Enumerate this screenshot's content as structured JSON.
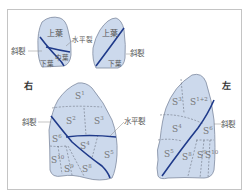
{
  "figure": {
    "top_right_lung": {
      "lobes": [
        "上葉",
        "中葉",
        "下葉"
      ],
      "labels": {
        "oblique_fissure": "斜裂",
        "horizontal_fissure": "水平裂"
      }
    },
    "top_left_lung": {
      "lobes": [
        "上葉",
        "下葉"
      ],
      "labels": {
        "oblique_fissure": "斜裂"
      }
    },
    "right_lung": {
      "side_label": "右",
      "fissure_labels": {
        "oblique": "斜裂",
        "horizontal": "水平裂"
      },
      "segments": [
        {
          "base": "S",
          "sup": "1"
        },
        {
          "base": "S",
          "sup": "2"
        },
        {
          "base": "S",
          "sup": "3"
        },
        {
          "base": "S",
          "sup": "4"
        },
        {
          "base": "S",
          "sup": "5"
        },
        {
          "base": "S",
          "sup": "6"
        },
        {
          "base": "S",
          "sup": "8"
        },
        {
          "base": "S",
          "sup": "9"
        },
        {
          "base": "S",
          "sup": "10"
        }
      ]
    },
    "left_lung": {
      "side_label": "左",
      "fissure_labels": {
        "oblique": "斜裂"
      },
      "segments": [
        {
          "base": "S",
          "sup": "3"
        },
        {
          "base": "S",
          "sup": "1+2"
        },
        {
          "base": "S",
          "sup": "4"
        },
        {
          "base": "S",
          "sup": "5"
        },
        {
          "base": "S",
          "sup": "6"
        },
        {
          "base": "S",
          "sup": "8"
        },
        {
          "base": "S",
          "sup": "9"
        },
        {
          "base": "S",
          "sup": "10"
        }
      ]
    },
    "colors": {
      "lung_fill": "#ccd9ec",
      "lung_stroke": "#7f8aa0",
      "fissure": "#1f3a8a",
      "segment_line": "#6b7280"
    }
  }
}
